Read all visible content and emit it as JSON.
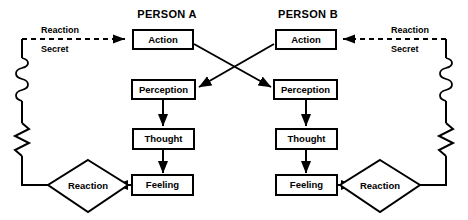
{
  "diagram": {
    "title_hidden": "Interpersonal reaction loop between two people",
    "stroke_color": "#000000",
    "background_color": "#ffffff"
  },
  "headers": [
    {
      "id": "person-a",
      "label": "PERSON A"
    },
    {
      "id": "person-b",
      "label": "PERSON B"
    }
  ],
  "person_a": {
    "action": "Action",
    "perception": "Perception",
    "thought": "Thought",
    "feeling": "Feeling",
    "reaction": "Reaction"
  },
  "person_b": {
    "action": "Action",
    "perception": "Perception",
    "thought": "Thought",
    "feeling": "Feeling",
    "reaction": "Reaction"
  },
  "feedback_left": {
    "line1": "Reaction",
    "line2": "Secret"
  },
  "feedback_right": {
    "line1": "Reaction",
    "line2": "Secret"
  }
}
